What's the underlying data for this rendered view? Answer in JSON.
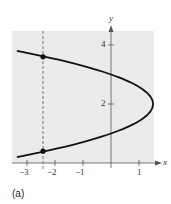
{
  "chart_data": {
    "type": "line",
    "title": "",
    "subfigure_label": "(a)",
    "xlabel": "x",
    "ylabel": "y",
    "xlim": [
      -3.5,
      1.6
    ],
    "ylim": [
      0,
      4.5
    ],
    "x_ticks": [
      "-3",
      "-2",
      "-1",
      "1"
    ],
    "y_ticks": [
      "2",
      "4"
    ],
    "grid": false,
    "series": [
      {
        "name": "parabola x = 1.5 - 1.5(y-2)^2",
        "equation": "x = 1.5 - 1.5(y - 2)^2",
        "vertex": [
          1.5,
          2
        ],
        "y_intercepts": [
          1,
          3
        ]
      }
    ],
    "annotations": [
      {
        "type": "vertical-dashed-line",
        "x": -2.3
      },
      {
        "type": "point",
        "x": -2.3,
        "y": 3.6
      },
      {
        "type": "point",
        "x": -2.3,
        "y": 0.4
      }
    ]
  },
  "labels": {
    "x_axis": "x",
    "y_axis": "y",
    "xt_m3": "−3",
    "xt_m2": "−2",
    "xt_m1": "−1",
    "xt_1": "1",
    "yt_2": "2",
    "yt_4": "4",
    "sub": "(a)"
  }
}
